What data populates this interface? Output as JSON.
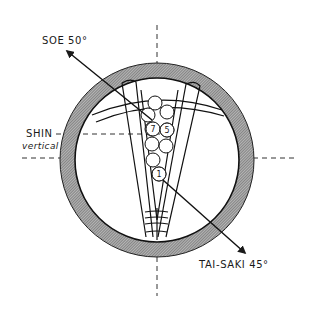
{
  "diagram": {
    "labels": {
      "soe": "SOE 50°",
      "shin": "SHIN",
      "shin_sub": "vertical",
      "tai_saki": "TAI-SAKI 45°"
    },
    "numbers": {
      "n7": "7",
      "n5": "5",
      "n1": "1"
    },
    "colors": {
      "ink": "#1a1a1a",
      "ring_fill": "#8a8a8a",
      "background": "#ffffff"
    },
    "angles": {
      "soe_deg": 50,
      "tai_saki_deg": 45
    }
  }
}
